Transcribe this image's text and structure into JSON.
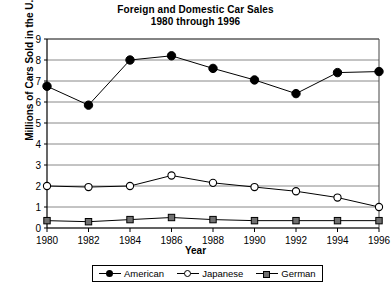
{
  "chart_data": {
    "type": "line",
    "title": "Foreign and Domestic Car Sales",
    "subtitle": "1980 through 1996",
    "xlabel": "Year",
    "ylabel": "Millions of Cars Sold in the U.S.",
    "x": [
      1980,
      1982,
      1984,
      1986,
      1988,
      1990,
      1992,
      1994,
      1996
    ],
    "xtick_labels": [
      "1980",
      "1982",
      "1984",
      "1986",
      "1988",
      "1990",
      "1992",
      "1994",
      "1996"
    ],
    "ytick_labels": [
      "0",
      "1",
      "2",
      "3",
      "4",
      "5",
      "6",
      "7",
      "8",
      "9"
    ],
    "xlim": [
      1980,
      1996
    ],
    "ylim": [
      0,
      9
    ],
    "grid": "horizontal",
    "legend_position": "bottom",
    "series": [
      {
        "name": "American",
        "marker": "filled-circle",
        "color": "#000000",
        "values": [
          6.75,
          5.85,
          8.0,
          8.2,
          7.6,
          7.05,
          6.4,
          7.4,
          7.45
        ]
      },
      {
        "name": "Japanese",
        "marker": "open-circle",
        "color": "#000000",
        "values": [
          2.0,
          1.95,
          2.0,
          2.5,
          2.15,
          1.95,
          1.75,
          1.45,
          1.0
        ]
      },
      {
        "name": "German",
        "marker": "filled-square",
        "color": "#707070",
        "values": [
          0.35,
          0.3,
          0.4,
          0.5,
          0.4,
          0.35,
          0.35,
          0.35,
          0.35
        ]
      }
    ]
  }
}
